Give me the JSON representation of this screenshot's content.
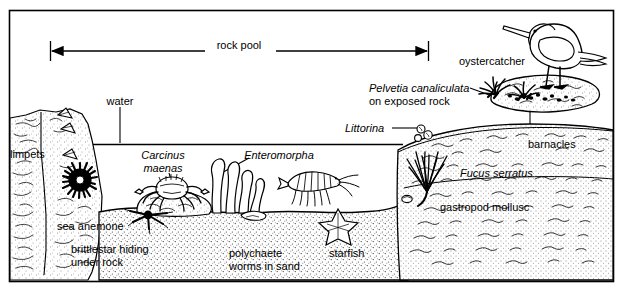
{
  "figure": {
    "type": "labelled biological cross-section",
    "frame_color": "#000000",
    "background_color": "#ffffff",
    "ink_color": "#000000"
  },
  "scale_bar": {
    "label": "rock pool",
    "x_start": 50,
    "x_end": 428,
    "y": 51,
    "arrow_style": "double-headed with end ticks"
  },
  "labels": [
    {
      "id": "rock-pool",
      "text": "rock pool",
      "x": 239,
      "y": 45,
      "italic": false,
      "align": "center"
    },
    {
      "id": "water",
      "text": "water",
      "x": 120,
      "y": 101,
      "italic": false,
      "align": "center"
    },
    {
      "id": "limpets",
      "text": "limpets",
      "x": 10,
      "y": 154,
      "italic": false,
      "align": "left"
    },
    {
      "id": "sea-anemone",
      "text": "sea anemone",
      "x": 57,
      "y": 226,
      "italic": false,
      "align": "left"
    },
    {
      "id": "brittlestar-1",
      "text": "brittlestar hiding",
      "x": 71,
      "y": 249,
      "italic": false,
      "align": "left"
    },
    {
      "id": "brittlestar-2",
      "text": "under rock",
      "x": 71,
      "y": 262,
      "italic": false,
      "align": "left"
    },
    {
      "id": "carcinus-1",
      "text": "Carcinus",
      "x": 163,
      "y": 155,
      "italic": true,
      "align": "center"
    },
    {
      "id": "carcinus-2",
      "text": "maenas",
      "x": 163,
      "y": 168,
      "italic": true,
      "align": "center"
    },
    {
      "id": "enteromorpha",
      "text": "Enteromorpha",
      "x": 279,
      "y": 155,
      "italic": true,
      "align": "center"
    },
    {
      "id": "polychaete-1",
      "text": "polychaete",
      "x": 229,
      "y": 253,
      "italic": false,
      "align": "left"
    },
    {
      "id": "polychaete-2",
      "text": "worms in sand",
      "x": 229,
      "y": 266,
      "italic": false,
      "align": "left"
    },
    {
      "id": "starfish",
      "text": "starfish",
      "x": 329,
      "y": 253,
      "italic": false,
      "align": "left"
    },
    {
      "id": "littorina",
      "text": "Littorina",
      "x": 345,
      "y": 124,
      "italic": true,
      "align": "left"
    },
    {
      "id": "pelvetia-1",
      "text": "Pelvetia canaliculata",
      "x": 369,
      "y": 84,
      "italic": true,
      "align": "left"
    },
    {
      "id": "pelvetia-2",
      "text": "on exposed rock",
      "x": 369,
      "y": 97,
      "italic": false,
      "align": "left"
    },
    {
      "id": "oystercatcher",
      "text": "oystercatcher",
      "x": 459,
      "y": 57,
      "italic": false,
      "align": "left"
    },
    {
      "id": "barnacles",
      "text": "barnacles",
      "x": 528,
      "y": 140,
      "italic": false,
      "align": "left"
    },
    {
      "id": "fucus",
      "text": "Fucus serratus",
      "x": 460,
      "y": 169,
      "italic": true,
      "align": "left"
    },
    {
      "id": "gastropod",
      "text": "gastropod mollusc",
      "x": 440,
      "y": 203,
      "italic": false,
      "align": "left"
    }
  ],
  "organisms": [
    {
      "name": "oystercatcher",
      "common": true,
      "habitat": "exposed rock above pool"
    },
    {
      "name": "Pelvetia canaliculata",
      "common": false,
      "habitat": "exposed rock"
    },
    {
      "name": "Littorina",
      "common": false,
      "habitat": "rock edge"
    },
    {
      "name": "barnacles",
      "common": true,
      "habitat": "exposed rock"
    },
    {
      "name": "Fucus serratus",
      "common": false,
      "habitat": "lower rock"
    },
    {
      "name": "gastropod mollusc",
      "common": true,
      "habitat": "rock base"
    },
    {
      "name": "limpets",
      "common": true,
      "habitat": "vertical rock face"
    },
    {
      "name": "sea anemone",
      "common": true,
      "habitat": "rock face in pool"
    },
    {
      "name": "brittlestar",
      "common": true,
      "habitat": "hiding under rock"
    },
    {
      "name": "Carcinus maenas",
      "common": false,
      "habitat": "on rock in pool"
    },
    {
      "name": "Enteromorpha",
      "common": false,
      "habitat": "pool floor"
    },
    {
      "name": "polychaete worms",
      "common": true,
      "habitat": "in sand"
    },
    {
      "name": "starfish",
      "common": true,
      "habitat": "on sand"
    }
  ],
  "water_line": {
    "y": 144,
    "x_start": 35,
    "x_end": 403
  },
  "leaders": [
    {
      "from": "water",
      "x1": 120,
      "y1": 106,
      "x2": 120,
      "y2": 143
    },
    {
      "from": "limpets",
      "x1": 48,
      "y1": 150,
      "x2": 45,
      "y2": 128
    },
    {
      "from": "sea-anemone",
      "x1": 80,
      "y1": 221,
      "x2": 76,
      "y2": 186
    },
    {
      "from": "brittlestar",
      "x1": 146,
      "y1": 245,
      "x2": 146,
      "y2": 215
    },
    {
      "from": "carcinus",
      "x1": 170,
      "y1": 172,
      "x2": 173,
      "y2": 192
    },
    {
      "from": "enteromorpha",
      "x1": 249,
      "y1": 159,
      "x2": 216,
      "y2": 177
    },
    {
      "from": "polychaete",
      "x1": 248,
      "y1": 249,
      "x2": 248,
      "y2": 221
    },
    {
      "from": "starfish",
      "x1": 338,
      "y1": 249,
      "x2": 338,
      "y2": 226
    },
    {
      "from": "littorina",
      "x1": 392,
      "y1": 128,
      "x2": 416,
      "y2": 128
    },
    {
      "from": "pelvetia",
      "x1": 469,
      "y1": 88,
      "x2": 491,
      "y2": 95
    },
    {
      "from": "oystercatcher",
      "x1": 536,
      "y1": 54,
      "x2": 548,
      "y2": 44
    },
    {
      "from": "barnacles",
      "x1": 530,
      "y1": 136,
      "x2": 530,
      "y2": 100
    },
    {
      "from": "fucus",
      "x1": 456,
      "y1": 172,
      "x2": 437,
      "y2": 172
    },
    {
      "from": "gastropod",
      "x1": 436,
      "y1": 206,
      "x2": 411,
      "y2": 200
    }
  ]
}
